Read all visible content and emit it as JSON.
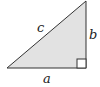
{
  "diagram": {
    "type": "right-triangle",
    "labels": {
      "hypotenuse": "c",
      "vertical_leg": "b",
      "horizontal_leg": "a"
    },
    "colors": {
      "fill": "#e2e2e2",
      "stroke": "#333333"
    },
    "right_angle_marker": true
  }
}
